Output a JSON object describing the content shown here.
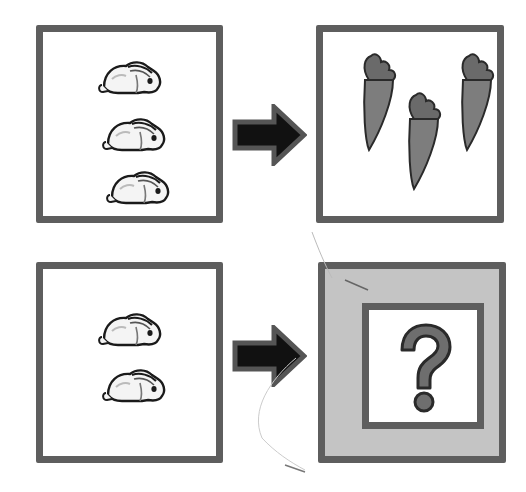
{
  "puzzle": {
    "rows": [
      {
        "left": {
          "item": "rabbit",
          "count": 3
        },
        "connector": "arrow-right",
        "right": {
          "item": "carrot",
          "count": 3
        }
      },
      {
        "left": {
          "item": "rabbit",
          "count": 2
        },
        "connector": "arrow-right",
        "right": {
          "item": "question-mark",
          "symbol": "?",
          "highlighted": true
        }
      }
    ]
  },
  "colors": {
    "border": "#5e5e5e",
    "arrow_fill": "#111111",
    "arrow_outline": "#555555",
    "carrot": "#7a7a7a",
    "answer_background": "#c4c4c4",
    "question_mark": "#6e6e6e"
  }
}
